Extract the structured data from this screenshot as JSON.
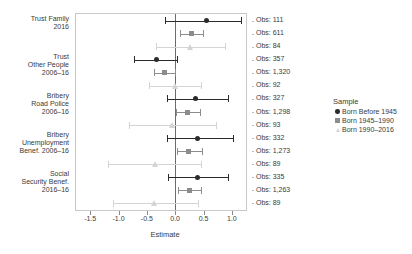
{
  "chart_data": {
    "type": "scatter",
    "subtype": "forest-coefficient-plot",
    "title": "",
    "xlabel": "Estimate",
    "ylabel": "",
    "xlim": [
      -1.75,
      1.25
    ],
    "xticks": [
      -1.5,
      -1.0,
      -0.5,
      0.0,
      0.5,
      1.0
    ],
    "xticklabels": [
      "-1.5",
      "-1.0",
      "-0.5",
      "0.0",
      "0.5",
      "1.0"
    ],
    "grid": false,
    "reference_line": 0.0,
    "legend_position": "right",
    "legend_title": "Sample",
    "series": [
      {
        "name": "Born Before 1945",
        "marker": "circle",
        "color": "#2b2b2b"
      },
      {
        "name": "Born 1945–1990",
        "marker": "square",
        "color": "#8c8c8c"
      },
      {
        "name": "Born 1990–2016",
        "marker": "triangle",
        "color": "#d4d4d4"
      }
    ],
    "categories": [
      "Trust Family\n2016",
      "Trust\nOther People\n2006–16",
      "Bribery\nRoad Police\n2006–16",
      "Bribery\nUnemployment\nBenef. 2006–16",
      "Social\nSecurity Benef.\n2016–16"
    ],
    "points": [
      {
        "category": 0,
        "series": 0,
        "estimate": 0.56,
        "ci_low": -0.18,
        "ci_high": 1.16,
        "obs": "Obs: 111"
      },
      {
        "category": 0,
        "series": 1,
        "estimate": 0.29,
        "ci_low": 0.09,
        "ci_high": 0.49,
        "obs": "Obs: 611"
      },
      {
        "category": 0,
        "series": 2,
        "estimate": 0.27,
        "ci_low": -0.33,
        "ci_high": 0.88,
        "obs": "Obs: 84"
      },
      {
        "category": 1,
        "series": 0,
        "estimate": -0.33,
        "ci_low": -0.72,
        "ci_high": 0.03,
        "obs": "Obs: 357"
      },
      {
        "category": 1,
        "series": 1,
        "estimate": -0.19,
        "ci_low": -0.38,
        "ci_high": -0.01,
        "obs": "Obs: 1,320"
      },
      {
        "category": 1,
        "series": 2,
        "estimate": -0.01,
        "ci_low": -0.47,
        "ci_high": 0.45,
        "obs": "Obs: 92"
      },
      {
        "category": 2,
        "series": 0,
        "estimate": 0.36,
        "ci_low": -0.15,
        "ci_high": 0.93,
        "obs": "Obs: 327"
      },
      {
        "category": 2,
        "series": 1,
        "estimate": 0.22,
        "ci_low": 0.02,
        "ci_high": 0.43,
        "obs": "Obs: 1,298"
      },
      {
        "category": 2,
        "series": 2,
        "estimate": -0.05,
        "ci_low": -0.82,
        "ci_high": 0.72,
        "obs": "Obs: 93"
      },
      {
        "category": 3,
        "series": 0,
        "estimate": 0.4,
        "ci_low": -0.15,
        "ci_high": 1.02,
        "obs": "Obs: 332"
      },
      {
        "category": 3,
        "series": 1,
        "estimate": 0.24,
        "ci_low": 0.03,
        "ci_high": 0.47,
        "obs": "Obs: 1,273"
      },
      {
        "category": 3,
        "series": 2,
        "estimate": -0.36,
        "ci_low": -1.18,
        "ci_high": 0.46,
        "obs": "Obs: 89"
      },
      {
        "category": 4,
        "series": 0,
        "estimate": 0.39,
        "ci_low": -0.12,
        "ci_high": 0.93,
        "obs": "Obs: 335"
      },
      {
        "category": 4,
        "series": 1,
        "estimate": 0.25,
        "ci_low": 0.05,
        "ci_high": 0.46,
        "obs": "Obs: 1,263"
      },
      {
        "category": 4,
        "series": 2,
        "estimate": -0.38,
        "ci_low": -1.1,
        "ci_high": 0.4,
        "obs": "Obs: 89"
      }
    ],
    "obs_labels": [
      "Obs: 111",
      "Obs: 611",
      "Obs: 84",
      "Obs: 357",
      "Obs: 1,320",
      "Obs: 92",
      "Obs: 327",
      "Obs: 1,298",
      "Obs: 93",
      "Obs: 332",
      "Obs: 1,273",
      "Obs: 89",
      "Obs: 335",
      "Obs: 1,263",
      "Obs: 89"
    ]
  },
  "colors": {
    "series_dark": "#2b2b2b",
    "series_mid": "#8c8c8c",
    "series_light": "#d4d4d4",
    "axis": "#8a8a8a",
    "frame": "#c9c9c9",
    "text": "#3a3a3a"
  }
}
